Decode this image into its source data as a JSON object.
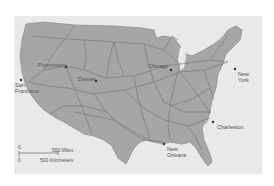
{
  "map": {
    "title": "",
    "colors": {
      "background": "#e9e9e9",
      "land": "#a6a6a6",
      "land_border": "#8e8e8e",
      "rail_lines": "#6f6f6f",
      "city_dot": "#2e2e2e",
      "label": "#505050"
    },
    "cities": [
      {
        "id": "san-francisco",
        "label_line1": "San",
        "label_line2": "Francisco"
      },
      {
        "id": "promontory",
        "label_line1": "Promontory"
      },
      {
        "id": "denver",
        "label_line1": "Denver"
      },
      {
        "id": "chicago",
        "label_line1": "Chicago"
      },
      {
        "id": "new-york",
        "label_line1": "New",
        "label_line2": "York"
      },
      {
        "id": "charleston",
        "label_line1": "Charleston"
      },
      {
        "id": "new-orleans",
        "label_line1": "New",
        "label_line2": "Orleans"
      }
    ],
    "scale_bar": {
      "zero": "0",
      "zero_km": "0",
      "miles": "500 Miles",
      "kilometers": "500 Kilometers"
    }
  }
}
